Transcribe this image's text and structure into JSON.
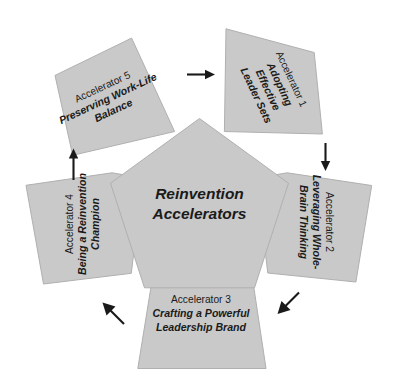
{
  "diagram": {
    "title": "Reinvention Accelerators",
    "center": {
      "line1": "Reinvention",
      "line2": "Accelerators"
    },
    "colors": {
      "petal_fill": "#c9c9c9",
      "petal_stroke": "#b0b0b0",
      "arrow": "#1a1a1a",
      "background": "#ffffff",
      "text": "#1a1a1a"
    },
    "petals": [
      {
        "id": "accelerator-1",
        "number_label": "Accelerator 1",
        "title_lines": [
          "Adopting",
          "Effective",
          "Leader Sets"
        ],
        "position": "top-right"
      },
      {
        "id": "accelerator-2",
        "number_label": "Accelerator 2",
        "title_lines": [
          "Leveraging Whole-",
          "Brain Thinking"
        ],
        "position": "right"
      },
      {
        "id": "accelerator-3",
        "number_label": "Accelerator 3",
        "title_lines": [
          "Crafting a Powerful",
          "Leadership Brand"
        ],
        "position": "bottom"
      },
      {
        "id": "accelerator-4",
        "number_label": "Accelerator 4",
        "title_lines": [
          "Being a Reinvention",
          "Champion"
        ],
        "position": "left"
      },
      {
        "id": "accelerator-5",
        "number_label": "Accelerator 5",
        "title_lines": [
          "Preserving Work-Life",
          "Balance"
        ],
        "position": "top-left"
      }
    ],
    "arrows": [
      {
        "id": "arrow-5-to-1",
        "from": "accelerator-5",
        "to": "accelerator-1",
        "direction": "right"
      },
      {
        "id": "arrow-1-to-2",
        "from": "accelerator-1",
        "to": "accelerator-2",
        "direction": "down"
      },
      {
        "id": "arrow-2-to-3",
        "from": "accelerator-2",
        "to": "accelerator-3",
        "direction": "down-left"
      },
      {
        "id": "arrow-3-to-4",
        "from": "accelerator-3",
        "to": "accelerator-4",
        "direction": "up-left"
      },
      {
        "id": "arrow-4-to-5",
        "from": "accelerator-4",
        "to": "accelerator-5",
        "direction": "up"
      }
    ]
  }
}
